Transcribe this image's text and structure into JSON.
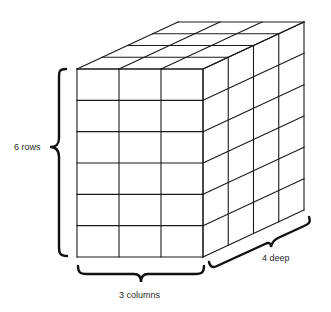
{
  "diagram": {
    "colors": {
      "line": "#1a1a1a",
      "brace": "#111111",
      "text": "#2a2a2a",
      "background": "#ffffff"
    },
    "prism": {
      "rows": 6,
      "columns": 3,
      "depth": 4,
      "front_origin": [
        77,
        69
      ],
      "front_width": 126,
      "front_height": 188,
      "depth_vector": [
        101,
        -47
      ]
    },
    "labels": {
      "rows": "6 rows",
      "columns": "3 columns",
      "depth": "4 deep"
    }
  }
}
